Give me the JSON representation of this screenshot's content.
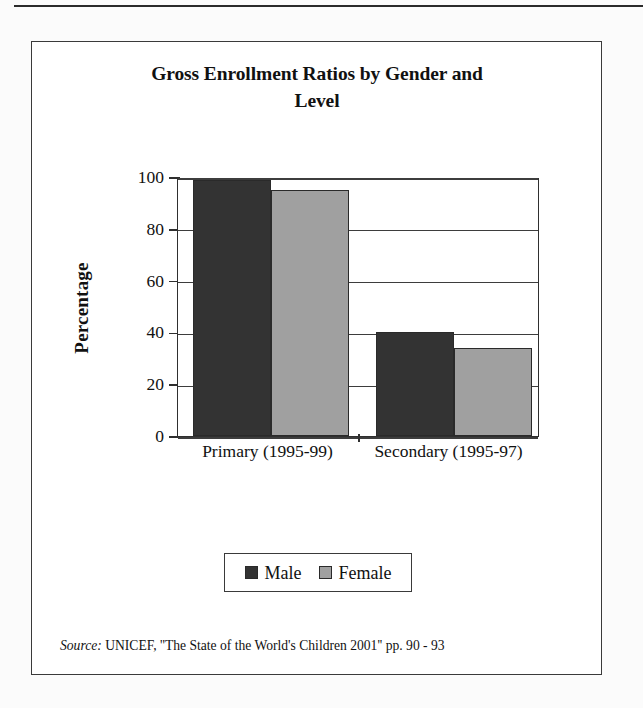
{
  "figure": {
    "title": "Gross Enrollment Ratios by Gender and Level",
    "title_line_1": "Gross Enrollment Ratios by Gender and",
    "title_line_2": "Level",
    "source_lead": "Source:",
    "source_text": "UNICEF, ''The State of the World's Children 2001'' pp. 90 - 93"
  },
  "colors": {
    "male": "#333333",
    "female": "#a0a0a0",
    "outline": "#2a2a2a",
    "axis": "#2f2f2f",
    "page_background": "#fbfbfb",
    "figure_background": "#ffffff"
  },
  "legend": {
    "entries": [
      {
        "label": "Male",
        "color": "#333333"
      },
      {
        "label": "Female",
        "color": "#a0a0a0"
      }
    ]
  },
  "axes": {
    "y_label": "Percentage",
    "y_ticks": [
      "100",
      "80",
      "60",
      "40",
      "20",
      "0"
    ],
    "x_tick_labels": [
      "Primary (1995-99)",
      "Secondary (1995-97)"
    ]
  },
  "chart_data": {
    "type": "bar",
    "title": "Gross Enrollment Ratios by Gender and Level",
    "xlabel": "",
    "ylabel": "Percentage",
    "ylim": [
      0,
      100
    ],
    "yticks": [
      0,
      20,
      40,
      60,
      80,
      100
    ],
    "grid": true,
    "grid_axis": "y",
    "legend_position": "bottom",
    "categories": [
      "Primary (1995-99)",
      "Secondary (1995-97)"
    ],
    "series": [
      {
        "name": "Male",
        "color": "#333333",
        "values": [
          99,
          40
        ]
      },
      {
        "name": "Female",
        "color": "#a0a0a0",
        "values": [
          95,
          34
        ]
      }
    ],
    "units": "percent",
    "source": "UNICEF, ''The State of the World's Children 2001'' pp. 90 - 93"
  }
}
